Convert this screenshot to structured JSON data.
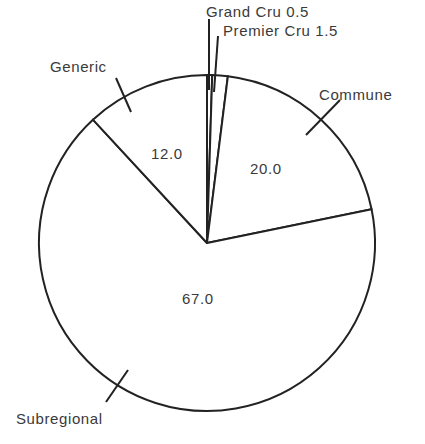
{
  "chart_data": {
    "type": "pie",
    "title": "",
    "categories": [
      "Grand Cru",
      "Premier Cru",
      "Commune",
      "Subregional",
      "Generic"
    ],
    "values": [
      0.5,
      1.5,
      20.0,
      67.0,
      12.0
    ],
    "value_labels": [
      "0.5",
      "1.5",
      "20.0",
      "67.0",
      "12.0"
    ],
    "start_angle_deg": 0,
    "direction": "clockwise",
    "legend": "none",
    "colors": {
      "fill": "#ffffff",
      "stroke": "#222222",
      "text": "#3a3a3a"
    }
  },
  "labels": {
    "grand_cru": "Grand Cru 0.5",
    "premier_cru": "Premier Cru 1.5",
    "commune": "Commune",
    "subregional": "Subregional",
    "generic": "Generic",
    "commune_value": "20.0",
    "subregional_value": "67.0",
    "generic_value": "12.0"
  }
}
